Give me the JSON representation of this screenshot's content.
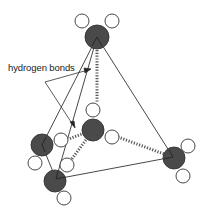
{
  "diagram": {
    "label": "hydrogen bonds",
    "colors": {
      "oxygen": "#4a4a4a",
      "hydrogen": "#ffffff",
      "stroke": "#333333",
      "bond": "#555555"
    },
    "molecules": [
      {
        "name": "top-water",
        "oxygen": {
          "cx": 97,
          "cy": 37,
          "r": 12
        },
        "hydrogens": [
          {
            "cx": 82,
            "cy": 21,
            "r": 7
          },
          {
            "cx": 112,
            "cy": 21,
            "r": 7
          }
        ]
      },
      {
        "name": "center-water",
        "oxygen": {
          "cx": 93,
          "cy": 130,
          "r": 11
        },
        "hydrogens": [
          {
            "cx": 93,
            "cy": 110,
            "r": 7
          },
          {
            "cx": 112,
            "cy": 137,
            "r": 7
          }
        ]
      },
      {
        "name": "left-water",
        "oxygen": {
          "cx": 42,
          "cy": 145,
          "r": 11
        },
        "hydrogens": [
          {
            "cx": 61,
            "cy": 140,
            "r": 7
          },
          {
            "cx": 35,
            "cy": 163,
            "r": 7
          }
        ]
      },
      {
        "name": "bottom-left-water",
        "oxygen": {
          "cx": 55,
          "cy": 181,
          "r": 11
        },
        "hydrogens": [
          {
            "cx": 67,
            "cy": 165,
            "r": 7
          },
          {
            "cx": 64,
            "cy": 198,
            "r": 7
          }
        ]
      },
      {
        "name": "right-water",
        "oxygen": {
          "cx": 174,
          "cy": 158,
          "r": 11
        },
        "hydrogens": [
          {
            "cx": 188,
            "cy": 146,
            "r": 7
          },
          {
            "cx": 183,
            "cy": 176,
            "r": 7
          }
        ]
      }
    ]
  }
}
